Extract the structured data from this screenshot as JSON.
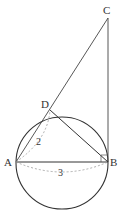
{
  "diagram": {
    "points": {
      "A": {
        "label": "A",
        "x": 16,
        "y": 162
      },
      "B": {
        "label": "B",
        "x": 108,
        "y": 162
      },
      "C": {
        "label": "C",
        "x": 108,
        "y": 18
      },
      "D": {
        "label": "D",
        "x": 50,
        "y": 110
      }
    },
    "circle": {
      "cx": 62,
      "cy": 163,
      "r": 46
    },
    "measures": {
      "AD": "2",
      "AB": "3"
    },
    "colors": {
      "line": "#333333",
      "dashed": "#999999"
    }
  }
}
